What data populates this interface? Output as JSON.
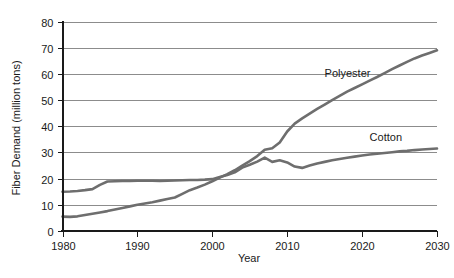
{
  "chart_data": {
    "type": "line",
    "title": "",
    "xlabel": "Year",
    "ylabel": "Fiber Demand (million tons)",
    "xlim": [
      1980,
      2030
    ],
    "ylim": [
      0,
      80
    ],
    "xticks": [
      1980,
      1990,
      2000,
      2010,
      2020,
      2030
    ],
    "ytkcks": [
      0,
      10,
      20,
      30,
      40,
      50,
      60,
      70,
      80
    ],
    "yticks": [
      0,
      10,
      20,
      30,
      40,
      50,
      60,
      70,
      80
    ],
    "grid": "horizontal",
    "legend_position": "inline-annotation",
    "line_color": "#6e6e6e",
    "axis_color": "#1a1a1a",
    "gridline_color": "#8c8c8c",
    "background_color": "#ffffff",
    "x": [
      1980,
      1981,
      1982,
      1983,
      1984,
      1985,
      1986,
      1987,
      1988,
      1989,
      1990,
      1991,
      1992,
      1993,
      1994,
      1995,
      1996,
      1997,
      1998,
      1999,
      2000,
      2001,
      2002,
      2003,
      2004,
      2005,
      2006,
      2007,
      2008,
      2009,
      2010,
      2011,
      2012,
      2013,
      2014,
      2015,
      2016,
      2017,
      2018,
      2019,
      2020,
      2021,
      2022,
      2023,
      2024,
      2025,
      2026,
      2027,
      2028,
      2029,
      2030
    ],
    "series": [
      {
        "name": "Cotton",
        "label": "Cotton",
        "color": "#6e6e6e",
        "label_x": 2021,
        "label_y": 34.5,
        "values": [
          15.0,
          15.1,
          15.3,
          15.6,
          16.0,
          17.6,
          18.9,
          19.0,
          19.1,
          19.1,
          19.2,
          19.2,
          19.2,
          19.1,
          19.2,
          19.3,
          19.4,
          19.5,
          19.5,
          19.6,
          19.8,
          20.6,
          21.4,
          22.4,
          24.2,
          25.3,
          26.5,
          28.0,
          26.4,
          27.0,
          26.2,
          24.6,
          24.1,
          25.0,
          25.8,
          26.4,
          27.0,
          27.5,
          28.0,
          28.4,
          28.8,
          29.2,
          29.5,
          29.8,
          30.1,
          30.4,
          30.6,
          30.9,
          31.1,
          31.3,
          31.5
        ]
      },
      {
        "name": "Polyester",
        "label": "Polyester",
        "color": "#6e6e6e",
        "label_x": 2015,
        "label_y": 59.0,
        "values": [
          5.5,
          5.4,
          5.6,
          6.1,
          6.6,
          7.1,
          7.6,
          8.2,
          8.8,
          9.4,
          10.0,
          10.5,
          11.0,
          11.6,
          12.2,
          12.8,
          14.2,
          15.6,
          16.6,
          17.7,
          19.0,
          20.4,
          21.7,
          23.2,
          25.0,
          26.7,
          28.6,
          31.0,
          31.6,
          33.8,
          38.0,
          41.0,
          43.0,
          44.8,
          46.6,
          48.3,
          50.0,
          51.6,
          53.2,
          54.6,
          56.0,
          57.4,
          58.8,
          60.3,
          61.8,
          63.2,
          64.6,
          65.9,
          67.0,
          68.0,
          69.0
        ]
      }
    ]
  },
  "axis": {
    "y_title": "Fiber Demand (million tons)",
    "x_title": "Year",
    "y_tick_labels": [
      "0",
      "10",
      "20",
      "30",
      "40",
      "50",
      "60",
      "70",
      "80"
    ],
    "x_tick_labels": [
      "1980",
      "1990",
      "2000",
      "2010",
      "2020",
      "2030"
    ]
  },
  "labels": {
    "polyester": "Polyester",
    "cotton": "Cotton"
  }
}
